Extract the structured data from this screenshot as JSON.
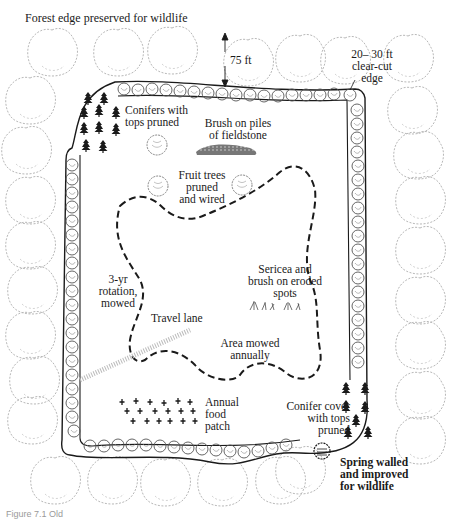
{
  "diagram": {
    "title": "Forest edge preserved for wildlife",
    "labels": {
      "distance_75": "75 ft",
      "clear_cut": [
        "20– 30 ft",
        "clear-cut",
        "edge"
      ],
      "conifers_top": [
        "Conifers with",
        "tops pruned"
      ],
      "brush_piles": [
        "Brush on piles",
        "of fieldstone"
      ],
      "fruit_trees": [
        "Fruit trees",
        "pruned",
        "and wired"
      ],
      "rotation": [
        "3-yr",
        "rotation,",
        "mowed"
      ],
      "sericea": [
        "Sericea and",
        "brush on eroded",
        "spots"
      ],
      "travel_lane": "Travel lane",
      "area_mowed": [
        "Area mowed",
        "annually"
      ],
      "annual_food": [
        "Annual",
        "food",
        "patch"
      ],
      "conifer_cover": [
        "Conifer cover",
        "with tops",
        "pruned"
      ],
      "spring": [
        "Spring walled",
        "and improved",
        "for wildlife"
      ]
    },
    "caption": "Figure 7.1  Old"
  }
}
